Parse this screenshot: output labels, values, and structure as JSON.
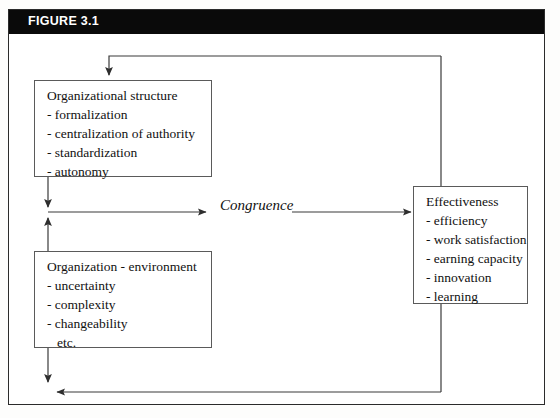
{
  "figure": {
    "header_label": "FIGURE 3.1",
    "header_bg": "#0a0a0a",
    "header_text_color": "#ffffff",
    "frame_border_color": "#2b2b2b",
    "box_border_color": "#5a5a5a",
    "wire_color": "#3a3a3a"
  },
  "diagram": {
    "type": "flow-diagram",
    "relation_label": "Congruence",
    "nodes": [
      {
        "id": "organizational-structure",
        "title": "Organizational structure",
        "items": [
          "- formalization",
          "- centralization of authority",
          "- standardization",
          "- autonomy"
        ]
      },
      {
        "id": "organization-environment",
        "title": "Organization - environment",
        "items": [
          "- uncertainty",
          "- complexity",
          "- changeability",
          "etc."
        ]
      },
      {
        "id": "effectiveness",
        "title": "Effectiveness",
        "items": [
          "- efficiency",
          "- work satisfaction",
          "- earning capacity",
          "- innovation",
          "- learning"
        ]
      }
    ],
    "edges": [
      {
        "from": "organizational-structure",
        "to": "congruence",
        "kind": "arrow-right"
      },
      {
        "from": "congruence",
        "to": "effectiveness",
        "kind": "arrow-right"
      },
      {
        "from": "organization-environment",
        "to": "congruence",
        "kind": "arrow-up"
      },
      {
        "from": "effectiveness",
        "to": "organizational-structure",
        "kind": "feedback-top"
      },
      {
        "from": "effectiveness",
        "to": "organization-environment",
        "kind": "feedback-bottom"
      }
    ]
  }
}
